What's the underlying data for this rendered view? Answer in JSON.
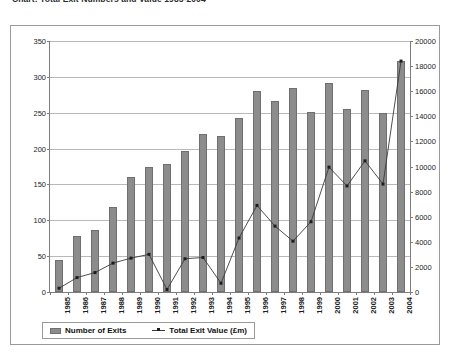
{
  "chart_title": "Chart: Total Exit Numbers and Value 1985-2004",
  "legend": {
    "bar_label": "Number of Exits",
    "line_label": "Total Exit Value (£m)",
    "bar_color": "#8c8c8c",
    "line_color": "#3a3a3a"
  },
  "axes": {
    "left_ticks": [
      "0",
      "50",
      "100",
      "150",
      "200",
      "250",
      "300",
      "350"
    ],
    "right_ticks": [
      "0",
      "2000",
      "4000",
      "6000",
      "8000",
      "10000",
      "12000",
      "14000",
      "16000",
      "18000",
      "20000"
    ]
  },
  "chart_data": {
    "type": "bar",
    "title": "Chart: Total Exit Numbers and Value 1985-2004",
    "xlabel": "",
    "ylabel": "Number of Exits",
    "y2label": "Total Exit Value (£m)",
    "ylim": [
      0,
      350
    ],
    "y2lim": [
      0,
      20000
    ],
    "grid": true,
    "legend_position": "bottom-left",
    "categories": [
      "1985",
      "1986",
      "1987",
      "1988",
      "1989",
      "1990",
      "1991",
      "1992",
      "1993",
      "1994",
      "1995",
      "1996",
      "1997",
      "1998",
      "1999",
      "2000",
      "2001",
      "2002",
      "2003",
      "2004"
    ],
    "series": [
      {
        "name": "Number of Exits",
        "type": "bar",
        "axis": "left",
        "values": [
          44,
          78,
          86,
          118,
          160,
          174,
          179,
          196,
          221,
          217,
          243,
          280,
          267,
          285,
          251,
          292,
          255,
          282,
          249,
          322
        ]
      },
      {
        "name": "Total Exit Value (£m)",
        "type": "line",
        "axis": "right",
        "values": [
          300,
          1150,
          1550,
          2300,
          2700,
          3000,
          200,
          2650,
          2750,
          700,
          4300,
          6900,
          5250,
          4050,
          5600,
          9950,
          8450,
          10450,
          8600,
          18400
        ]
      }
    ]
  }
}
